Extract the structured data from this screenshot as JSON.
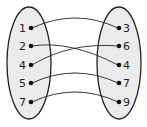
{
  "diagram": {
    "type": "mapping",
    "domain_set": [
      "1",
      "2",
      "4",
      "5",
      "7"
    ],
    "range_set": [
      "3",
      "6",
      "4",
      "7",
      "9"
    ],
    "mappings": [
      {
        "from": "1",
        "to": "3"
      },
      {
        "from": "2",
        "to": "4"
      },
      {
        "from": "4",
        "to": "6"
      },
      {
        "from": "5",
        "to": "7"
      },
      {
        "from": "7",
        "to": "9"
      }
    ],
    "colors": {
      "oval_fill": "#ebebeb",
      "stroke": "#222222"
    }
  }
}
